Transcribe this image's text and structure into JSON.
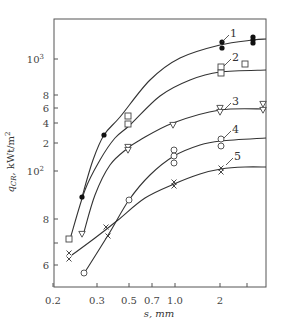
{
  "chart_data": {
    "type": "scatter",
    "title": "",
    "xlabel": "s, mm",
    "ylabel": "q_CR, kWt/m²",
    "ylabel_main": "q",
    "ylabel_sub": "CR",
    "ylabel_unit": ", kWt/m",
    "ylabel_sup": "2",
    "x_scale": "log",
    "y_scale": "log",
    "xlim": [
      0.2,
      3.5
    ],
    "ylim": [
      50,
      2000
    ],
    "grid": false,
    "legend": "inline curve numbers",
    "x_ticks": [
      {
        "label": "0.2",
        "px": 53
      },
      {
        "label": "0.3",
        "px": 97
      },
      {
        "label": "0.5",
        "px": 129
      },
      {
        "label": "0.7",
        "px": 152
      },
      {
        "label": "1.0",
        "px": 175
      },
      {
        "label": "2",
        "px": 220
      },
      {
        "label": "",
        "px": 247
      }
    ],
    "y_ticks": [
      {
        "label": "10",
        "sup": "3",
        "px": 59
      },
      {
        "label": "8",
        "sup": "",
        "px": 95
      },
      {
        "label": "6",
        "sup": "",
        "px": 108
      },
      {
        "label": "4",
        "sup": "",
        "px": 123
      },
      {
        "label": "2",
        "sup": "",
        "px": 143
      },
      {
        "label": "10",
        "sup": "2",
        "px": 171
      },
      {
        "label": "8",
        "sup": "",
        "px": 219
      },
      {
        "label": "",
        "sup": "",
        "px": 243
      },
      {
        "label": "6",
        "sup": "",
        "px": 265
      }
    ],
    "series": [
      {
        "name": "1",
        "marker": "filled-circle",
        "points": [
          [
            0.27,
            90
          ],
          [
            0.35,
            250
          ],
          [
            2.0,
            1150
          ],
          [
            2.0,
            1050
          ],
          [
            3.0,
            1250
          ],
          [
            3.0,
            1200
          ],
          [
            3.0,
            1150
          ]
        ],
        "px": [
          [
            82,
            197
          ],
          [
            104,
            135
          ],
          [
            222,
            42
          ],
          [
            222,
            48
          ],
          [
            253,
            37
          ],
          [
            253,
            40
          ],
          [
            253,
            43
          ]
        ],
        "curve": [
          [
            82,
            197
          ],
          [
            93,
            160
          ],
          [
            104,
            135
          ],
          [
            120,
            117
          ],
          [
            150,
            80
          ],
          [
            180,
            58
          ],
          [
            220,
            45
          ],
          [
            253,
            40
          ],
          [
            266,
            39
          ]
        ],
        "label_pos": [
          230,
          34
        ]
      },
      {
        "name": "2",
        "marker": "open-square",
        "points": [
          [
            0.25,
            70
          ],
          [
            0.5,
            450
          ],
          [
            0.5,
            380
          ],
          [
            2.0,
            900
          ],
          [
            2.0,
            820
          ],
          [
            2.5,
            950
          ]
        ],
        "px": [
          [
            69,
            239
          ],
          [
            128,
            116
          ],
          [
            128,
            124
          ],
          [
            221,
            67
          ],
          [
            221,
            73
          ],
          [
            245,
            64
          ]
        ],
        "curve": [
          [
            71,
            236
          ],
          [
            85,
            190
          ],
          [
            100,
            160
          ],
          [
            115,
            138
          ],
          [
            130,
            125
          ],
          [
            160,
            96
          ],
          [
            190,
            80
          ],
          [
            220,
            72
          ],
          [
            266,
            70
          ]
        ],
        "label_pos": [
          232,
          58
        ]
      },
      {
        "name": "3",
        "marker": "open-triangle-down",
        "points": [
          [
            0.27,
            73
          ],
          [
            0.5,
            170
          ],
          [
            0.5,
            160
          ],
          [
            1.0,
            350
          ],
          [
            2.0,
            560
          ],
          [
            2.0,
            520
          ],
          [
            3.0,
            600
          ],
          [
            3.0,
            550
          ]
        ],
        "px": [
          [
            82,
            234
          ],
          [
            128,
            147
          ],
          [
            128,
            150
          ],
          [
            173,
            125
          ],
          [
            220,
            108
          ],
          [
            220,
            112
          ],
          [
            263,
            104
          ],
          [
            263,
            110
          ]
        ],
        "curve": [
          [
            84,
            232
          ],
          [
            95,
            195
          ],
          [
            110,
            165
          ],
          [
            128,
            148
          ],
          [
            140,
            140
          ],
          [
            173,
            123
          ],
          [
            220,
            110
          ],
          [
            266,
            109
          ]
        ],
        "label_pos": [
          232,
          102
        ]
      },
      {
        "name": "4",
        "marker": "open-circle",
        "points": [
          [
            0.27,
            55
          ],
          [
            0.5,
            88
          ],
          [
            1.0,
            150
          ],
          [
            1.0,
            130
          ],
          [
            1.0,
            115
          ],
          [
            2.0,
            220
          ],
          [
            2.0,
            190
          ]
        ],
        "px": [
          [
            84,
            273
          ],
          [
            129,
            200
          ],
          [
            174,
            150
          ],
          [
            174,
            156
          ],
          [
            174,
            163
          ],
          [
            221,
            139
          ],
          [
            221,
            146
          ]
        ],
        "curve": [
          [
            85,
            272
          ],
          [
            110,
            232
          ],
          [
            129,
            200
          ],
          [
            150,
            175
          ],
          [
            174,
            156
          ],
          [
            200,
            145
          ],
          [
            221,
            141
          ],
          [
            266,
            138
          ]
        ],
        "label_pos": [
          232,
          130
        ]
      },
      {
        "name": "5",
        "marker": "cross",
        "points": [
          [
            0.25,
            65
          ],
          [
            0.25,
            62
          ],
          [
            0.4,
            77
          ],
          [
            0.4,
            72
          ],
          [
            1.0,
            90
          ],
          [
            1.0,
            87
          ],
          [
            2.0,
            102
          ],
          [
            2.0,
            98
          ]
        ],
        "px": [
          [
            69,
            253
          ],
          [
            69,
            259
          ],
          [
            106,
            227
          ],
          [
            108,
            236
          ],
          [
            174,
            182
          ],
          [
            174,
            186
          ],
          [
            221,
            168
          ],
          [
            221,
            172
          ]
        ],
        "curve": [
          [
            72,
            255
          ],
          [
            95,
            238
          ],
          [
            118,
            220
          ],
          [
            145,
            198
          ],
          [
            174,
            184
          ],
          [
            200,
            174
          ],
          [
            221,
            169
          ],
          [
            245,
            167
          ],
          [
            266,
            167
          ]
        ],
        "label_pos": [
          234,
          157
        ]
      }
    ]
  }
}
